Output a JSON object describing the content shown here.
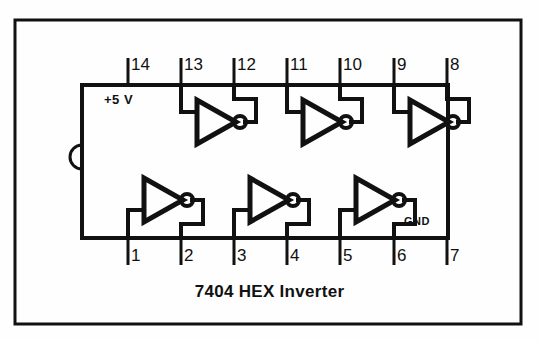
{
  "diagram": {
    "title": "7404 HEX Inverter",
    "caption": "7404 HEX Inverter",
    "power_label": "+5 V",
    "ground_label": "GND",
    "colors": {
      "ink": "#111111",
      "background": "#fefefe",
      "border": "#111111"
    },
    "pins_top": [
      {
        "number": "14",
        "x": 128,
        "role": "vcc"
      },
      {
        "number": "13",
        "x": 181,
        "role": "input"
      },
      {
        "number": "12",
        "x": 234,
        "role": "output"
      },
      {
        "number": "11",
        "x": 287,
        "role": "input"
      },
      {
        "number": "10",
        "x": 340,
        "role": "output"
      },
      {
        "number": "9",
        "x": 394,
        "role": "input"
      },
      {
        "number": "8",
        "x": 447,
        "role": "output"
      }
    ],
    "pins_bottom": [
      {
        "number": "1",
        "x": 128,
        "role": "input"
      },
      {
        "number": "2",
        "x": 181,
        "role": "output"
      },
      {
        "number": "3",
        "x": 234,
        "role": "input"
      },
      {
        "number": "4",
        "x": 287,
        "role": "output"
      },
      {
        "number": "5",
        "x": 340,
        "role": "input"
      },
      {
        "number": "6",
        "x": 394,
        "role": "output"
      },
      {
        "number": "7",
        "x": 447,
        "role": "gnd"
      }
    ],
    "gates": [
      {
        "name": "inverter-top-1",
        "row": "top",
        "input_pin": "13",
        "output_pin": "12"
      },
      {
        "name": "inverter-top-2",
        "row": "top",
        "input_pin": "11",
        "output_pin": "10"
      },
      {
        "name": "inverter-top-3",
        "row": "top",
        "input_pin": "9",
        "output_pin": "8"
      },
      {
        "name": "inverter-bottom-1",
        "row": "bottom",
        "input_pin": "1",
        "output_pin": "2"
      },
      {
        "name": "inverter-bottom-2",
        "row": "bottom",
        "input_pin": "3",
        "output_pin": "4"
      },
      {
        "name": "inverter-bottom-3",
        "row": "bottom",
        "input_pin": "5",
        "output_pin": "6"
      }
    ]
  }
}
